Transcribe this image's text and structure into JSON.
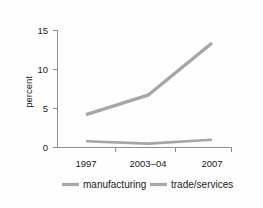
{
  "chart_data": {
    "type": "line",
    "title": "",
    "xlabel": "",
    "ylabel": "percent",
    "categories": [
      "1997",
      "2003–04",
      "2007"
    ],
    "x_tick_labels": [
      "1997",
      "2003–04",
      "2007"
    ],
    "y_tick_labels": [
      "0",
      "5",
      "10",
      "15"
    ],
    "y_ticks": [
      0,
      5,
      10,
      15
    ],
    "ylim": [
      0,
      15
    ],
    "grid": false,
    "legend_position": "bottom",
    "series": [
      {
        "name": "manufacturing",
        "values": [
          4.2,
          6.7,
          13.4
        ],
        "color": "#a6a6a6",
        "line_width": 3.4
      },
      {
        "name": "trade/services",
        "values": [
          0.8,
          0.5,
          1.0
        ],
        "color": "#a6a6a6",
        "line_width": 2.6
      }
    ]
  },
  "axes": {
    "y_axis_title": "percent",
    "y_labels": [
      "15",
      "10",
      "5",
      "0"
    ],
    "x_labels": [
      "1997",
      "2003–04",
      "2007"
    ],
    "axis_color": "#8c8c8c"
  },
  "legend": {
    "items": [
      {
        "label": "manufacturing",
        "color": "#a6a6a6"
      },
      {
        "label": "trade/services",
        "color": "#a6a6a6"
      }
    ]
  },
  "colors": {
    "background": "#fefefe",
    "text": "#1a1a1a",
    "series_gray": "#a6a6a6",
    "axis_gray": "#8c8c8c"
  }
}
